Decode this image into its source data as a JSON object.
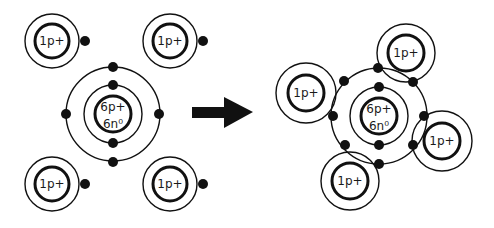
{
  "diagram": {
    "colors": {
      "stroke": "#111111",
      "background": "#ffffff"
    },
    "reactants": {
      "hydrogen_atoms": [
        {
          "label": "1p+",
          "position": "top-left"
        },
        {
          "label": "1p+",
          "position": "top-right"
        },
        {
          "label": "1p+",
          "position": "bottom-left"
        },
        {
          "label": "1p+",
          "position": "bottom-right"
        }
      ],
      "carbon_atom": {
        "protons": "6p+",
        "neutrons": "6n⁰"
      }
    },
    "arrow": {
      "direction": "right",
      "icon": "arrow-right-icon"
    },
    "product": {
      "carbon_atom": {
        "protons": "6p+",
        "neutrons": "6n⁰"
      },
      "hydrogen_atoms": [
        {
          "label": "1p+",
          "position": "top"
        },
        {
          "label": "1p+",
          "position": "left"
        },
        {
          "label": "1p+",
          "position": "right"
        },
        {
          "label": "1p+",
          "position": "bottom"
        }
      ]
    }
  }
}
